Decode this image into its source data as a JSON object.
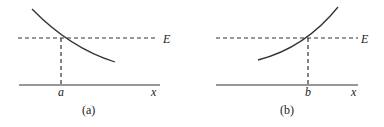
{
  "panels": [
    {
      "id": "a",
      "caption": "(a)",
      "point_label": "a",
      "axis_label": "x",
      "level_label": "E",
      "curve": "decreasing"
    },
    {
      "id": "b",
      "caption": "(b)",
      "point_label": "b",
      "axis_label": "x",
      "level_label": "E",
      "curve": "increasing"
    }
  ],
  "colors": {
    "line": "#333333",
    "background": "#ffffff"
  }
}
